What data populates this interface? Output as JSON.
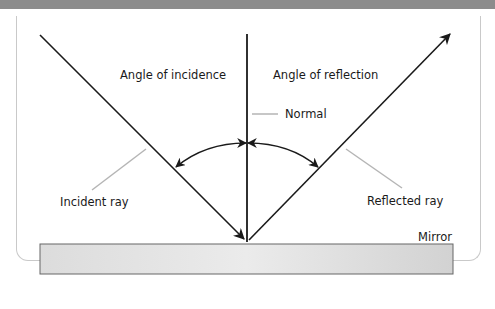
{
  "diagram": {
    "labels": {
      "angle_incidence": "Angle of incidence",
      "angle_reflection": "Angle of reflection",
      "normal": "Normal",
      "incident_ray": "Incident ray",
      "reflected_ray": "Reflected ray",
      "mirror": "Mirror"
    },
    "colors": {
      "line": "#1a1a1a",
      "leader": "#b5b5b5",
      "mirror_fill": "#d6d6d6",
      "mirror_border": "#555555",
      "band": "#8c8c8c"
    }
  }
}
